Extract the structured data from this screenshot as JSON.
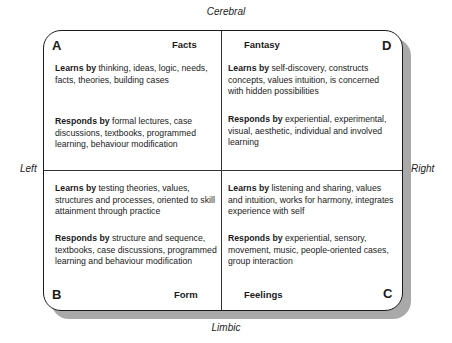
{
  "axes": {
    "top": "Cerebral",
    "bottom": "Limbic",
    "left": "Left",
    "right": "Right"
  },
  "quadrants": {
    "A": {
      "letter": "A",
      "title": "Facts",
      "learns_label": "Learns by",
      "learns_text": " thinking, ideas, logic, needs, facts, theories, building cases",
      "responds_label": "Responds by",
      "responds_text": " formal lectures, case discussions, textbooks, programmed learning, behaviour modification"
    },
    "D": {
      "letter": "D",
      "title": "Fantasy",
      "learns_label": "Learns by",
      "learns_text": " self-discovery, constructs concepts, values intuition, is concerned with hidden possibilities",
      "responds_label": "Responds by",
      "responds_text": " experiential, experimental, visual, aesthetic, individual and involved learning"
    },
    "B": {
      "letter": "B",
      "title": "Form",
      "learns_label": "Learns by",
      "learns_text": " testing theories, values, structures and processes, oriented to skill attainment through practice",
      "responds_label": "Responds by",
      "responds_text": " structure and sequence, textbooks, case discussions, programmed learning and behaviour modification"
    },
    "C": {
      "letter": "C",
      "title": "Feelings",
      "learns_label": "Learns by",
      "learns_text": " listening and sharing, values and intuition, works for harmony, integrates experience with self",
      "responds_label": "Responds by",
      "responds_text": " experiential, sensory, movement, music, people-oriented cases, group interaction"
    }
  }
}
